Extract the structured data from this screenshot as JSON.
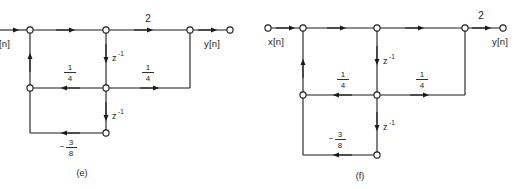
{
  "figure": {
    "type": "signal-flow-graph-pair",
    "background": "#ffffff",
    "stroke": "#1a1a1a",
    "panels": [
      {
        "id": "e",
        "caption": "(e)",
        "clipped_left": true,
        "input_label": "[n]",
        "input_label_full": "x[n]",
        "output_label": "y[n]",
        "gains": {
          "forward_out": "2",
          "feedback_mid_left": "1/4",
          "feedforward_mid_right": "1/4",
          "feedback_bottom": "-3/8"
        },
        "delays": [
          "z^-1",
          "z^-1"
        ],
        "delay_label": "z",
        "delay_exponent": "-1",
        "fractions": {
          "quarter_numerator": "1",
          "quarter_denominator": "4",
          "three_eighths_sign": "−",
          "three_eighths_numerator": "3",
          "three_eighths_denominator": "8"
        }
      },
      {
        "id": "f",
        "caption": "(f)",
        "clipped_left": false,
        "input_label": "x[n]",
        "input_label_full": "x[n]",
        "output_label": "y[n]",
        "gains": {
          "forward_out": "2",
          "feedback_mid_left": "1/4",
          "feedforward_mid_right": "1/4",
          "feedback_bottom": "-3/8"
        },
        "delays": [
          "z^-1",
          "z^-1"
        ],
        "delay_label": "z",
        "delay_exponent": "-1",
        "fractions": {
          "quarter_numerator": "1",
          "quarter_denominator": "4",
          "three_eighths_sign": "−",
          "three_eighths_numerator": "3",
          "three_eighths_denominator": "8"
        }
      }
    ]
  }
}
